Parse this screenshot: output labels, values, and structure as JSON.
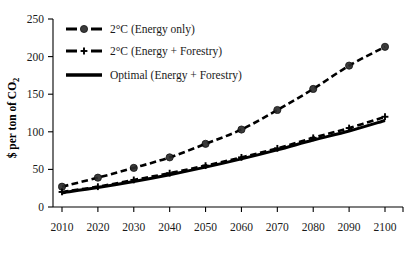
{
  "chart_data": {
    "type": "line",
    "title": "",
    "xlabel": "",
    "ylabel": "$ per ton of CO₂",
    "x": [
      2010,
      2020,
      2030,
      2040,
      2050,
      2060,
      2070,
      2080,
      2090,
      2100
    ],
    "xtick_labels": [
      "2010",
      "2020",
      "2030",
      "2040",
      "2050",
      "2060",
      "2070",
      "2080",
      "2090",
      "2100"
    ],
    "ytick_labels": [
      "0",
      "50",
      "100",
      "150",
      "200",
      "250"
    ],
    "yticks": [
      0,
      50,
      100,
      150,
      200,
      250
    ],
    "ylim": [
      0,
      250
    ],
    "xlim": [
      2010,
      2100
    ],
    "grid": false,
    "legend_position": "upper-left",
    "series": [
      {
        "name": "2°C (Energy only)",
        "values": [
          27,
          39,
          52,
          66,
          84,
          103,
          129,
          157,
          188,
          213
        ],
        "style": "dashed",
        "marker": "circle",
        "color": "#000000"
      },
      {
        "name": "2°C (Energy + Forestry)",
        "values": [
          20,
          27,
          36,
          45,
          55,
          66,
          78,
          92,
          105,
          120
        ],
        "style": "dashed",
        "marker": "plus",
        "color": "#000000"
      },
      {
        "name": "Optimal (Energy + Forestry)",
        "values": [
          19,
          26,
          34,
          43,
          53,
          64,
          76,
          89,
          101,
          115
        ],
        "style": "solid",
        "marker": "none",
        "color": "#000000"
      }
    ]
  },
  "axis": {
    "y_title": "$ per ton of CO₂",
    "y_title_main": "$ per ton of CO",
    "y_title_sub": "2"
  },
  "legend": {
    "items": [
      {
        "label": "2°C (Energy only)"
      },
      {
        "label": "2°C (Energy + Forestry)"
      },
      {
        "label": "Optimal (Energy + Forestry)"
      }
    ]
  }
}
